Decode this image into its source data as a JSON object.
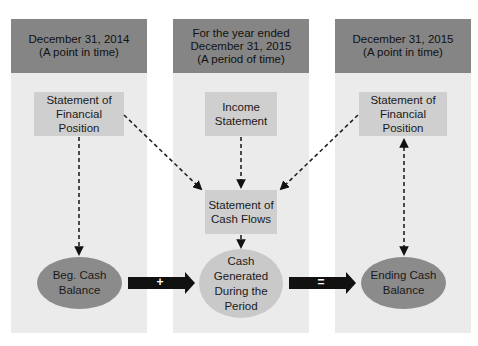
{
  "columns": [
    {
      "header": {
        "line1": "December 31, 2014",
        "line2": "(A point in time)",
        "line3": ""
      },
      "statement": {
        "line1": "Statement of",
        "line2": "Financial Position"
      },
      "ellipse": {
        "line1": "Beg. Cash",
        "line2": "Balance",
        "line3": ""
      }
    },
    {
      "header": {
        "line1": "For the year ended",
        "line2": "December 31, 2015",
        "line3": "(A period of time)"
      },
      "statement": {
        "line1": "Income",
        "line2": "Statement"
      },
      "cash_flows": {
        "line1": "Statement of",
        "line2": "Cash Flows"
      },
      "ellipse": {
        "line1": "Cash Generated",
        "line2": "During the",
        "line3": "Period"
      }
    },
    {
      "header": {
        "line1": "December 31, 2015",
        "line2": "(A point in time)",
        "line3": ""
      },
      "statement": {
        "line1": "Statement of",
        "line2": "Financial Position"
      },
      "ellipse": {
        "line1": "Ending Cash",
        "line2": "Balance",
        "line3": ""
      }
    }
  ],
  "operators": {
    "plus": "+",
    "equals": "="
  },
  "colors": {
    "header": "#858585",
    "column_bg": "#ebebeb",
    "box": "#cfcfcf",
    "ellipse_dark": "#8b8b8b",
    "ellipse_light": "#c9c9c9",
    "arrow": "#111111"
  }
}
